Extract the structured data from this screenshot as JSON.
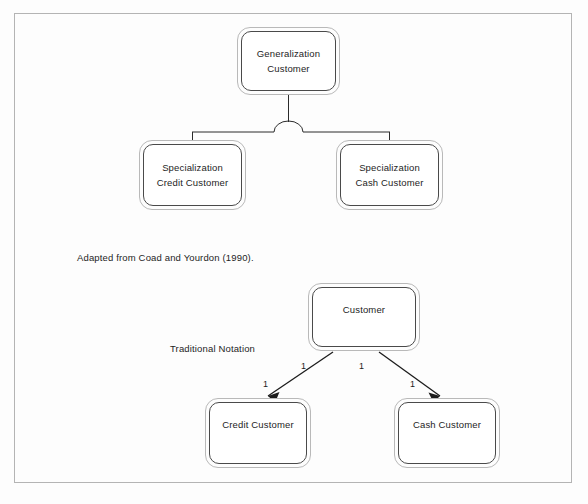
{
  "page": {
    "background_color": "#fdfdfd",
    "frame_color": "#b4b4b4"
  },
  "diagram_top": {
    "name": "coad-yourdon-generalization-specialization",
    "parent": {
      "id": "generalization-customer",
      "line1": "Generalization",
      "line2": "Customer"
    },
    "children": [
      {
        "id": "specialization-credit-customer",
        "line1": "Specialization",
        "line2": "Credit Customer"
      },
      {
        "id": "specialization-cash-customer",
        "line1": "Specialization",
        "line2": "Cash Customer"
      }
    ],
    "connector_notation": "semicircle-generalization-arc"
  },
  "caption": {
    "text": "Adapted from Coad and Yourdon (1990)."
  },
  "diagram_bottom": {
    "name": "traditional-notation",
    "label": "Traditional Notation",
    "parent": {
      "id": "customer",
      "line1": "Customer"
    },
    "children": [
      {
        "id": "credit-customer",
        "line1": "Credit Customer"
      },
      {
        "id": "cash-customer",
        "line1": "Cash Customer"
      }
    ],
    "multiplicities": [
      {
        "id": "mult-parent-left",
        "value": "1"
      },
      {
        "id": "mult-parent-right",
        "value": "1"
      },
      {
        "id": "mult-child-left",
        "value": "1"
      },
      {
        "id": "mult-child-right",
        "value": "1"
      }
    ],
    "connector_notation": "arrowhead-lines"
  },
  "colors": {
    "box_outer_stroke": "#b9b9b9",
    "box_inner_stroke": "#4a4a4a",
    "line_stroke": "#2b2b2b",
    "text": "#1d1d1d"
  }
}
